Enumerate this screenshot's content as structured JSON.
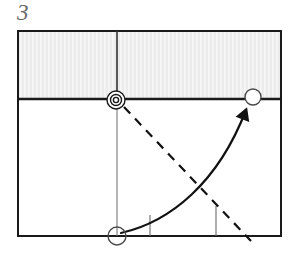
{
  "figure": {
    "label": "3",
    "label_color": "#6a6a6a",
    "background": "#ffffff"
  },
  "diagram": {
    "type": "mechanical-schematic",
    "frame": {
      "name": "outer-rectangle",
      "x": 18,
      "y": 31,
      "width": 263,
      "height": 205,
      "stroke": "#1a1a1a",
      "stroke_width": 2,
      "fill": "#ffffff"
    },
    "shaded_band": {
      "name": "shaded-band",
      "x": 18,
      "y": 31,
      "width": 263,
      "height": 68,
      "fill": "#ececec",
      "stripe_color": "#f5f5f5",
      "bottom_edge_stroke": "#1a1a1a",
      "bottom_edge_width": 2.6
    },
    "divider_upper": {
      "name": "vertical-divider-upper",
      "x": 117,
      "y1": 31,
      "y2": 100,
      "stroke": "#333333",
      "stroke_width": 1.6
    },
    "divider_lower": {
      "name": "vertical-divider-lower",
      "x": 117,
      "y1": 100,
      "y2": 236,
      "stroke": "#6b6b6b",
      "stroke_width": 1.0
    },
    "bullseye": {
      "name": "bullseye-marker",
      "cx": 116,
      "cy": 100,
      "outer_r": 9,
      "inner_r": 5.5,
      "core_r": 2.6,
      "stroke": "#1a1a1a",
      "stroke_width": 1.4
    },
    "circle_right": {
      "name": "circle-marker-right",
      "cx": 253,
      "cy": 97,
      "r": 8,
      "stroke": "#4a4a4a",
      "stroke_width": 1.4,
      "fill": "#ffffff"
    },
    "circle_bottom": {
      "name": "circle-marker-bottom",
      "cx": 117,
      "cy": 236,
      "r": 9,
      "stroke": "#4a4a4a",
      "stroke_width": 1.4,
      "fill": "#ffffff"
    },
    "curved_arrow": {
      "name": "curved-trajectory-arrow",
      "start_x": 121,
      "start_y": 233,
      "control1_x": 170,
      "control1_y": 222,
      "control2_x": 218,
      "control2_y": 183,
      "end_x": 246,
      "end_y": 110,
      "stroke": "#111111",
      "stroke_width": 2.2,
      "arrowhead_size": 13
    },
    "dashed_line": {
      "name": "dashed-reference-line",
      "x1": 124,
      "y1": 107,
      "x2": 251,
      "y2": 241,
      "stroke": "#111111",
      "stroke_width": 2.2,
      "dash_pattern": "9 7"
    },
    "tick_left": {
      "name": "tick-mark-left",
      "x": 150,
      "y1": 215,
      "y2": 236,
      "stroke": "#6b6b6b",
      "stroke_width": 1.1
    },
    "tick_right": {
      "name": "tick-mark-right",
      "x": 216,
      "y1": 206,
      "y2": 236,
      "stroke": "#6b6b6b",
      "stroke_width": 1.1
    }
  }
}
